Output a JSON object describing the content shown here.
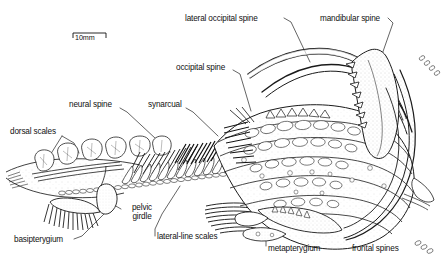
{
  "figure": {
    "kind": "scientific-line-drawing"
  },
  "scale_bar": {
    "label": "10mm",
    "length_px": 33
  },
  "labels": [
    {
      "id": "lateral-occipital-spine",
      "text": "lateral occipital spine",
      "x": 185,
      "y": 14,
      "align": "left"
    },
    {
      "id": "mandibular-spine",
      "text": "mandibular spine",
      "x": 320,
      "y": 14,
      "align": "left"
    },
    {
      "id": "occipital-spine",
      "text": "occipital spine",
      "x": 176,
      "y": 68,
      "align": "left"
    },
    {
      "id": "neural-spine",
      "text": "neural spine",
      "x": 69,
      "y": 104,
      "align": "left"
    },
    {
      "id": "synarcual",
      "text": "synarcual",
      "x": 148,
      "y": 104,
      "align": "left"
    },
    {
      "id": "dorsal-scales",
      "text": "dorsal scales",
      "x": 10,
      "y": 131,
      "align": "left"
    },
    {
      "id": "pelvic-girdle",
      "text": "pelvic\ngirdle",
      "x": 122,
      "y": 205,
      "align": "left"
    },
    {
      "id": "basipterygium",
      "text": "basipterygium",
      "x": 14,
      "y": 238,
      "align": "left"
    },
    {
      "id": "lateral-line-scales",
      "text": "lateral-line scales",
      "x": 155,
      "y": 234,
      "align": "left"
    },
    {
      "id": "metapterygium",
      "text": "metapterygium",
      "x": 266,
      "y": 247,
      "align": "left"
    },
    {
      "id": "frontal-spines",
      "text": "frontal spines",
      "x": 350,
      "y": 247,
      "align": "left"
    }
  ],
  "colors": {
    "ink": "#111111",
    "line": "#1a1a1a",
    "wash": "#9a9a9a",
    "light_wash": "#c9c9c9",
    "paper": "#ffffff"
  }
}
